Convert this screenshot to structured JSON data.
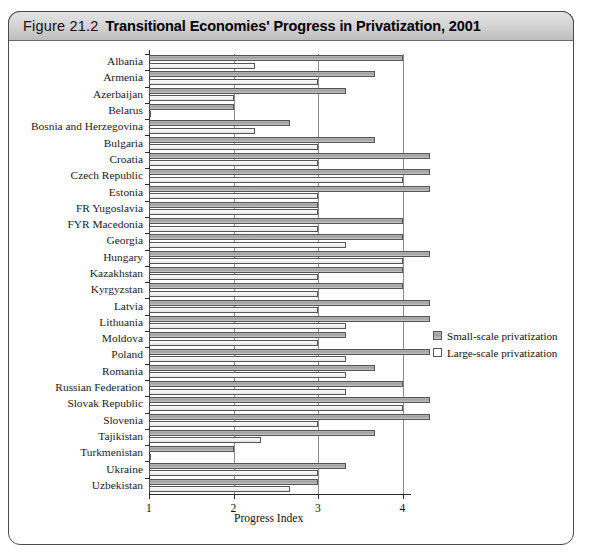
{
  "figure": {
    "number_label": "Figure 21.2",
    "title": "Transitional Economies' Progress in Privatization, 2001"
  },
  "legend": {
    "position": "right-middle",
    "items": [
      {
        "key": "small",
        "label": "Small-scale privatization",
        "swatch": "filled-gray-square"
      },
      {
        "key": "large",
        "label": "Large-scale privatization",
        "swatch": "open-white-square"
      }
    ]
  },
  "axis": {
    "x_title": "Progress Index",
    "x_ticks": [
      "1",
      "2",
      "3",
      "4"
    ],
    "x_min": 1,
    "x_max": 4.33,
    "gridlines_at": [
      2,
      3,
      4
    ]
  },
  "chart_data": {
    "type": "bar",
    "orientation": "horizontal",
    "title": "Transitional Economies' Progress in Privatization, 2001",
    "xlabel": "Progress Index",
    "ylabel": "",
    "xlim": [
      1,
      4.33
    ],
    "grid": true,
    "legend_position": "right",
    "categories": [
      "Albania",
      "Armenia",
      "Azerbaijan",
      "Belarus",
      "Bosnia and Herzegovina",
      "Bulgaria",
      "Croatia",
      "Czech Republic",
      "Estonia",
      "FR Yugoslavia",
      "FYR Macedonia",
      "Georgia",
      "Hungary",
      "Kazakhstan",
      "Kyrgyzstan",
      "Latvia",
      "Lithuania",
      "Moldova",
      "Poland",
      "Romania",
      "Russian Federation",
      "Slovak Republic",
      "Slovenia",
      "Tajikistan",
      "Turkmenistan",
      "Ukraine",
      "Uzbekistan"
    ],
    "series": [
      {
        "name": "Small-scale privatization",
        "values": [
          4.0,
          3.67,
          3.33,
          2.0,
          2.67,
          3.67,
          4.33,
          4.33,
          4.33,
          3.0,
          4.0,
          4.0,
          4.33,
          4.0,
          4.0,
          4.33,
          4.33,
          3.33,
          4.33,
          3.67,
          4.0,
          4.33,
          4.33,
          3.67,
          2.0,
          3.33,
          3.0
        ]
      },
      {
        "name": "Large-scale privatization",
        "values": [
          2.25,
          3.0,
          2.0,
          1.0,
          2.25,
          3.0,
          3.0,
          4.0,
          3.0,
          3.0,
          3.0,
          3.33,
          4.0,
          3.0,
          3.0,
          3.0,
          3.33,
          3.0,
          3.33,
          3.33,
          3.33,
          4.0,
          3.0,
          2.33,
          1.0,
          3.0,
          2.67
        ]
      }
    ]
  }
}
